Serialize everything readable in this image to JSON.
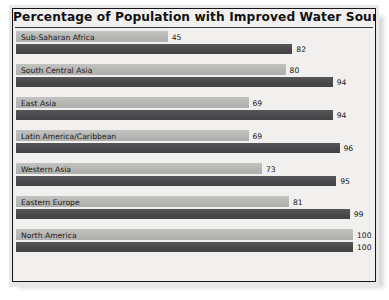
{
  "chart_data": {
    "type": "bar",
    "title": "Percentage of Population with Improved Water Sources",
    "xlabel": "",
    "ylabel": "",
    "xlim": [
      0,
      100
    ],
    "grid": false,
    "legend": "none",
    "orientation": "horizontal",
    "categories": [
      "Sub-Saharan Africa",
      "South Central Asia",
      "East Asia",
      "Latin America/Caribbean",
      "Western Asia",
      "Eastern Europe",
      "North America"
    ],
    "series": [
      {
        "name": "light",
        "values": [
          45,
          80,
          69,
          69,
          73,
          81,
          100
        ]
      },
      {
        "name": "dark",
        "values": [
          82,
          94,
          94,
          96,
          95,
          99,
          100
        ]
      }
    ],
    "rows": [
      {
        "category": "Sub-Saharan Africa",
        "light": 45,
        "light_text": "45",
        "dark": 82,
        "dark_text": "82"
      },
      {
        "category": "South Central Asia",
        "light": 80,
        "light_text": "80",
        "dark": 94,
        "dark_text": "94"
      },
      {
        "category": "East Asia",
        "light": 69,
        "light_text": "69",
        "dark": 94,
        "dark_text": "94"
      },
      {
        "category": "Latin America/Caribbean",
        "light": 69,
        "light_text": "69",
        "dark": 96,
        "dark_text": "96"
      },
      {
        "category": "Western Asia",
        "light": 73,
        "light_text": "73",
        "dark": 95,
        "dark_text": "95"
      },
      {
        "category": "Eastern Europe",
        "light": 81,
        "light_text": "81",
        "dark": 99,
        "dark_text": "99"
      },
      {
        "category": "North America",
        "light": 100,
        "light_text": "100",
        "dark": 100,
        "dark_text": "100"
      }
    ]
  },
  "colors": {
    "light_bar": "#b9b9b7",
    "dark_bar": "#4c4c4e",
    "frame": "#16161a",
    "plot_background": "#f1f0ee",
    "text": "#18181a"
  }
}
